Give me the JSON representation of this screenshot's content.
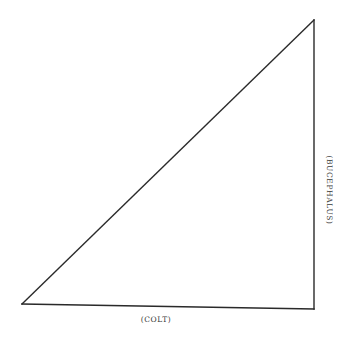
{
  "diagram": {
    "type": "right-triangle",
    "vertices": {
      "bottom_left": [
        22,
        304
      ],
      "bottom_right": [
        314,
        309
      ],
      "top_right": [
        314,
        20
      ]
    },
    "labels": {
      "bottom": "(COLT)",
      "right": "(BUCEPHALUS)"
    },
    "colors": {
      "stroke": "#2a2a2a",
      "background": "#ffffff",
      "label": "#3a3a3a"
    }
  }
}
